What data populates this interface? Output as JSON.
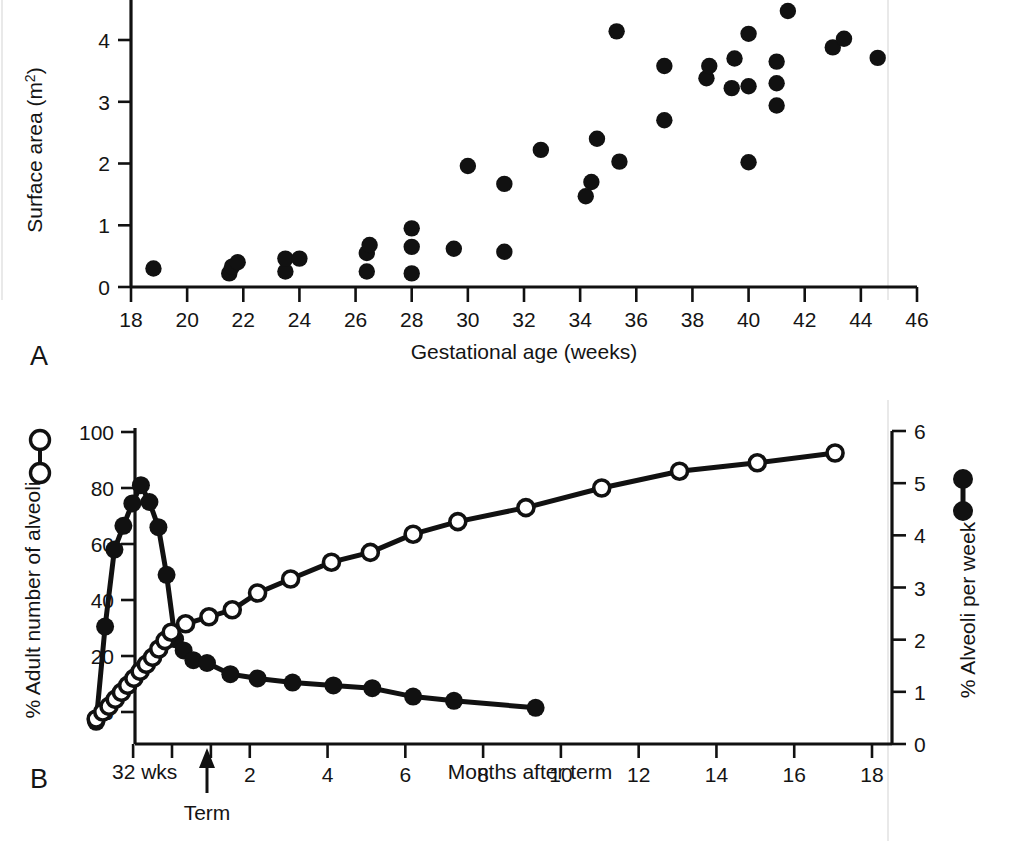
{
  "figure": {
    "panels": [
      {
        "letter": "A"
      },
      {
        "letter": "B"
      }
    ]
  },
  "panelA": {
    "letter": "A",
    "ylabel_main": "Surface area (m",
    "ylabel_sup": "2",
    "ylabel_close": ")",
    "xlabel": "Gestational age (weeks)",
    "yticks": [
      "0",
      "1",
      "2",
      "3",
      "4"
    ],
    "xticks": [
      "18",
      "20",
      "22",
      "24",
      "26",
      "28",
      "30",
      "32",
      "34",
      "36",
      "38",
      "40",
      "42",
      "44",
      "46"
    ]
  },
  "panelB": {
    "letter": "B",
    "ylabel_left": "% Adult number of alveoli",
    "ylabel_right": "% Alveoli per week",
    "xlabel": "Months after term",
    "start_label": "32 wks",
    "term_label": "Term",
    "yticks_left": [
      "0",
      "20",
      "40",
      "60",
      "80",
      "100"
    ],
    "yticks_right": [
      "0",
      "1",
      "2",
      "3",
      "4",
      "5",
      "6"
    ],
    "xticks": [
      "2",
      "4",
      "6",
      "8",
      "10",
      "12",
      "14",
      "16",
      "18"
    ]
  },
  "chart_data": [
    {
      "type": "scatter",
      "panel": "A",
      "title": "",
      "xlabel": "Gestational age (weeks)",
      "ylabel": "Surface area (m2)",
      "xlim": [
        18,
        46
      ],
      "ylim": [
        0,
        4.6
      ],
      "grid": false,
      "legend": "none",
      "marker": "filled-circle",
      "points": [
        [
          18.8,
          0.3
        ],
        [
          21.5,
          0.22
        ],
        [
          21.6,
          0.33
        ],
        [
          21.8,
          0.4
        ],
        [
          23.5,
          0.25
        ],
        [
          23.5,
          0.46
        ],
        [
          24.0,
          0.46
        ],
        [
          26.4,
          0.25
        ],
        [
          26.4,
          0.55
        ],
        [
          26.5,
          0.68
        ],
        [
          28.0,
          0.22
        ],
        [
          28.0,
          0.65
        ],
        [
          28.0,
          0.95
        ],
        [
          29.5,
          0.62
        ],
        [
          30.0,
          1.96
        ],
        [
          31.3,
          0.57
        ],
        [
          31.3,
          1.67
        ],
        [
          32.6,
          2.22
        ],
        [
          34.2,
          1.47
        ],
        [
          34.4,
          1.7
        ],
        [
          34.6,
          2.4
        ],
        [
          35.3,
          4.14
        ],
        [
          35.4,
          2.03
        ],
        [
          37.0,
          2.7
        ],
        [
          37.0,
          3.58
        ],
        [
          38.5,
          3.38
        ],
        [
          38.6,
          3.58
        ],
        [
          39.4,
          3.22
        ],
        [
          39.5,
          3.7
        ],
        [
          40.0,
          2.02
        ],
        [
          40.0,
          3.25
        ],
        [
          40.0,
          4.1
        ],
        [
          41.0,
          2.94
        ],
        [
          41.0,
          3.3
        ],
        [
          41.0,
          3.65
        ],
        [
          41.4,
          4.47
        ],
        [
          43.0,
          3.88
        ],
        [
          43.4,
          4.02
        ],
        [
          44.6,
          3.71
        ]
      ]
    },
    {
      "type": "line",
      "panel": "B",
      "title": "",
      "xlabel": "Months after term",
      "x_annotations": [
        {
          "label": "32 wks",
          "x": -2.0
        },
        {
          "label": "Term",
          "x": 0
        }
      ],
      "xlim": [
        -2.2,
        18.6
      ],
      "grid": false,
      "axes": [
        {
          "side": "left",
          "label": "% Adult number of alveoli",
          "range": [
            -5,
            100
          ],
          "ticks": [
            0,
            20,
            40,
            60,
            80,
            100
          ]
        },
        {
          "side": "right",
          "label": "% Alveoli per week",
          "range": [
            0,
            6
          ],
          "ticks": [
            0,
            1,
            2,
            3,
            4,
            5,
            6
          ]
        }
      ],
      "series": [
        {
          "name": "% Adult number of alveoli",
          "marker": "open-circle",
          "axis": "left",
          "x": [
            -1.95,
            -1.78,
            -1.62,
            -1.46,
            -1.3,
            -1.14,
            -0.98,
            -0.82,
            -0.66,
            -0.5,
            -0.34,
            -0.18,
            -0.02,
            0.35,
            0.95,
            1.55,
            2.2,
            3.05,
            4.1,
            5.1,
            6.2,
            7.35,
            9.1,
            11.05,
            13.05,
            15.05,
            17.05
          ],
          "values": [
            -2.5,
            0.0,
            2.0,
            4.5,
            7.0,
            9.5,
            12.0,
            14.5,
            17.0,
            19.5,
            22.5,
            25.5,
            28.5,
            31.5,
            34.0,
            36.5,
            42.5,
            47.5,
            53.5,
            57.0,
            63.5,
            68.0,
            73.0,
            80.0,
            86.0,
            89.0,
            92.5
          ]
        },
        {
          "name": "% Alveoli per week",
          "marker": "filled-circle",
          "axis": "left-scaled",
          "x": [
            -1.95,
            -1.72,
            -1.48,
            -1.25,
            -1.02,
            -0.8,
            -0.58,
            -0.35,
            -0.14,
            0.08,
            0.3,
            0.55,
            0.9,
            1.5,
            2.2,
            3.1,
            4.15,
            5.15,
            6.2,
            7.25,
            9.35,
            11.55,
            13.6,
            15.8,
            17.95
          ],
          "values": [
            -3.5,
            30.5,
            58.0,
            66.5,
            74.5,
            81.0,
            75.0,
            66.0,
            49.0,
            26.0,
            22.0,
            18.5,
            17.5,
            13.5,
            12.0,
            10.5,
            9.5,
            8.5,
            5.5,
            4.0,
            1.5
          ],
          "values_note": "left-axis equivalent positions for the filled curve"
        }
      ]
    }
  ]
}
